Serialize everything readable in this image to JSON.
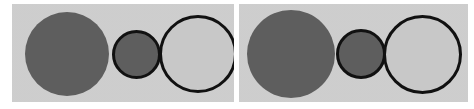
{
  "image": {
    "title": "Two-panel circle size comparison illustration",
    "width": 474,
    "height": 109,
    "background_color": "#ffffff"
  },
  "colors": {
    "page_background": "#ffffff",
    "panel_background": "#cfcfcf",
    "dark_gray_fill": "#5e5e5e",
    "light_gray_fill": "#c8c8c8",
    "outline_stroke": "#111111"
  },
  "panels": [
    {
      "name": "left-panel",
      "label": "Left panel",
      "x": 12,
      "y": 4,
      "width": 222,
      "height": 98,
      "background_color": "#cfcfcf",
      "shapes": [
        {
          "name": "large-dark-disc",
          "role": "large filled dark circle",
          "cx": 67,
          "cy": 54,
          "diameter": 84,
          "fill": "#5e5e5e",
          "stroke": "none",
          "stroke_width": 0
        },
        {
          "name": "medium-dark-outlined-disc",
          "role": "medium filled dark circle with black outline",
          "cx": 136,
          "cy": 54,
          "diameter": 49,
          "fill": "#5e5e5e",
          "stroke": "#111111",
          "stroke_width": 3
        },
        {
          "name": "large-light-outlined-circle",
          "role": "large light circle with black outline",
          "cx": 198,
          "cy": 54,
          "diameter": 78,
          "fill": "#c8c8c8",
          "stroke": "#111111",
          "stroke_width": 3
        }
      ]
    },
    {
      "name": "right-panel",
      "label": "Right panel",
      "x": 239,
      "y": 4,
      "width": 229,
      "height": 98,
      "background_color": "#cfcfcf",
      "shapes": [
        {
          "name": "large-dark-disc",
          "role": "large filled dark circle",
          "cx": 291,
          "cy": 54,
          "diameter": 88,
          "fill": "#5e5e5e",
          "stroke": "none",
          "stroke_width": 0
        },
        {
          "name": "medium-dark-outlined-disc",
          "role": "medium filled dark circle with black outline",
          "cx": 361,
          "cy": 54,
          "diameter": 50,
          "fill": "#5e5e5e",
          "stroke": "#111111",
          "stroke_width": 3
        },
        {
          "name": "large-light-outlined-circle",
          "role": "large light circle with black outline",
          "cx": 422,
          "cy": 54,
          "diameter": 79,
          "fill": "#c8c8c8",
          "stroke": "#111111",
          "stroke_width": 3
        }
      ]
    }
  ]
}
